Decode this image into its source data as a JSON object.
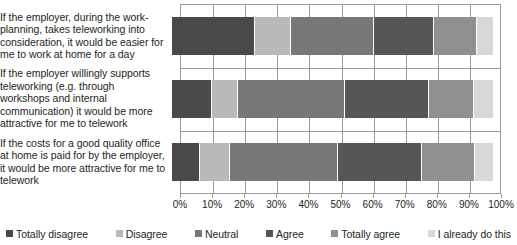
{
  "chart_data": {
    "type": "bar",
    "subtype": "stacked-horizontal-100pct",
    "title": "",
    "xlabel": "",
    "ylabel": "",
    "xlim": [
      0,
      100
    ],
    "xticks": [
      0,
      10,
      20,
      30,
      40,
      50,
      60,
      70,
      80,
      90,
      100
    ],
    "xtick_labels": [
      "0%",
      "10%",
      "20%",
      "30%",
      "40%",
      "50%",
      "60%",
      "70%",
      "80%",
      "90%",
      "100%"
    ],
    "grid": true,
    "legend_position": "bottom",
    "categories": [
      "If the employer, during the work-planning, takes teleworking into consideration, it would be easier for me to work at home for a day",
      "If the employer willingly supports teleworking (e.g. through workshops and internal communication) it would be more attractive for me to telework",
      "If the costs for a good quality office at home is paid for by the employer, it would be more attractive for me to telework"
    ],
    "series": [
      {
        "name": "Totally disagree",
        "color": "#4a4a4a",
        "values": [
          26,
          12.5,
          8.7
        ]
      },
      {
        "name": "Disagree",
        "color": "#b9b9b9",
        "values": [
          11,
          8,
          9.3
        ]
      },
      {
        "name": "Neutral",
        "color": "#787878",
        "values": [
          26,
          33.5,
          33.6
        ]
      },
      {
        "name": "Agree",
        "color": "#565656",
        "values": [
          18.6,
          26,
          26.4
        ]
      },
      {
        "name": "Totally agree",
        "color": "#909090",
        "values": [
          13.4,
          14,
          16.5
        ]
      },
      {
        "name": "I already do this",
        "color": "#d8d8d8",
        "values": [
          5,
          6,
          5.5
        ]
      }
    ]
  },
  "legend": {
    "items": [
      {
        "label": "Totally disagree",
        "color": "#4a4a4a"
      },
      {
        "label": "Disagree",
        "color": "#b9b9b9"
      },
      {
        "label": "Neutral",
        "color": "#787878"
      },
      {
        "label": "Agree",
        "color": "#565656"
      },
      {
        "label": "Totally agree",
        "color": "#909090"
      },
      {
        "label": "I already do this",
        "color": "#d8d8d8"
      }
    ]
  }
}
